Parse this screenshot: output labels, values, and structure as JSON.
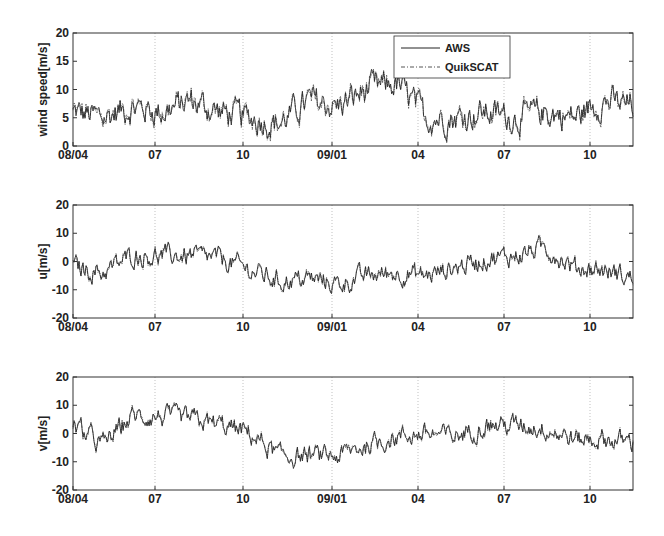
{
  "chart_data": [
    {
      "type": "line",
      "title": "",
      "xlabel": "",
      "ylabel": "wind speed[m/s]",
      "ylim": [
        0,
        20
      ],
      "yticks": [
        0,
        5,
        10,
        15,
        20
      ],
      "xtick_labels": [
        "08/04",
        "07",
        "10",
        "09/01",
        "04",
        "07",
        "10"
      ],
      "grid": "vertical dotted at x ticks",
      "legend": {
        "position": "upper right",
        "entries": [
          "AWS",
          "QuikSCAT"
        ]
      },
      "x": [
        "08/04",
        "08/05",
        "08/06",
        "08/07",
        "08/08",
        "08/09",
        "08/10",
        "08/11",
        "08/12",
        "09/01",
        "09/02",
        "09/03",
        "09/04",
        "09/05",
        "09/06",
        "09/07",
        "09/08",
        "09/09",
        "09/10",
        "09/11"
      ],
      "series": [
        {
          "name": "AWS",
          "style": "solid",
          "values": [
            6,
            5,
            7,
            6,
            8,
            6,
            5,
            4,
            8,
            7,
            10,
            11,
            5,
            5,
            6,
            5,
            6,
            5,
            8,
            7
          ]
        },
        {
          "name": "QuikSCAT",
          "style": "dash-dot",
          "values": [
            6,
            5,
            7,
            6,
            8,
            6,
            5,
            4,
            8,
            7,
            10,
            11,
            5,
            6,
            6,
            5,
            6,
            5,
            9,
            8
          ]
        }
      ]
    },
    {
      "type": "line",
      "title": "",
      "xlabel": "",
      "ylabel": "u[m/s]",
      "ylim": [
        -20,
        20
      ],
      "yticks": [
        -20,
        -10,
        0,
        10,
        20
      ],
      "xtick_labels": [
        "08/04",
        "07",
        "10",
        "09/01",
        "04",
        "07",
        "10"
      ],
      "grid": "vertical dotted at x ticks",
      "x": [
        "08/04",
        "08/05",
        "08/06",
        "08/07",
        "08/08",
        "08/09",
        "08/10",
        "08/11",
        "08/12",
        "09/01",
        "09/02",
        "09/03",
        "09/04",
        "09/05",
        "09/06",
        "09/07",
        "09/08",
        "09/09",
        "09/10",
        "09/11"
      ],
      "series": [
        {
          "name": "AWS",
          "style": "solid",
          "values": [
            -2,
            -4,
            2,
            2,
            2,
            1,
            -3,
            -7,
            -6,
            -8,
            -5,
            -4,
            -5,
            -2,
            1,
            2,
            5,
            -2,
            -3,
            -6
          ]
        },
        {
          "name": "QuikSCAT",
          "style": "dash-dot",
          "values": [
            -2,
            -4,
            2,
            2,
            2,
            1,
            -3,
            -7,
            -6,
            -8,
            -5,
            -4,
            -5,
            -2,
            1,
            2,
            5,
            -2,
            -3,
            -6
          ]
        }
      ]
    },
    {
      "type": "line",
      "title": "",
      "xlabel": "",
      "ylabel": "v[m/s]",
      "ylim": [
        -20,
        20
      ],
      "yticks": [
        -20,
        -10,
        0,
        10,
        20
      ],
      "xtick_labels": [
        "08/04",
        "07",
        "10",
        "09/01",
        "04",
        "07",
        "10"
      ],
      "grid": "vertical dotted at x ticks",
      "x": [
        "08/04",
        "08/05",
        "08/06",
        "08/07",
        "08/08",
        "08/09",
        "08/10",
        "08/11",
        "08/12",
        "09/01",
        "09/02",
        "09/03",
        "09/04",
        "09/05",
        "09/06",
        "09/07",
        "09/08",
        "09/09",
        "09/10",
        "09/11"
      ],
      "series": [
        {
          "name": "AWS",
          "style": "solid",
          "values": [
            3,
            -4,
            6,
            6,
            5,
            3,
            0,
            -8,
            -8,
            -8,
            -4,
            -1,
            0,
            -1,
            3,
            3,
            2,
            -2,
            -2,
            -3
          ]
        },
        {
          "name": "QuikSCAT",
          "style": "dash-dot",
          "values": [
            3,
            -4,
            6,
            6,
            5,
            3,
            0,
            -8,
            -8,
            -8,
            -4,
            -1,
            0,
            -1,
            3,
            3,
            2,
            -2,
            -2,
            -3
          ]
        }
      ]
    }
  ],
  "labels": {
    "panel1_ylabel": "wind speed[m/s]",
    "panel2_ylabel": "u[m/s]",
    "panel3_ylabel": "v[m/s]",
    "legend_aws": "AWS",
    "legend_quikscat": "QuikSCAT",
    "xticks": [
      "08/04",
      "07",
      "10",
      "09/01",
      "04",
      "07",
      "10"
    ],
    "yticks_speed": [
      "20",
      "15",
      "10",
      "5",
      "0"
    ],
    "yticks_comp": [
      "20",
      "10",
      "0",
      "-10",
      "-20"
    ]
  }
}
